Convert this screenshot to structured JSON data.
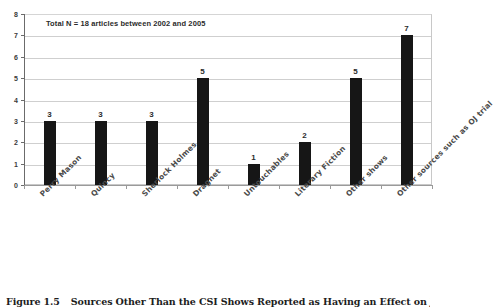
{
  "chart_data": {
    "type": "bar",
    "title": "",
    "subtitle": "",
    "annotation": "Total N = 18 articles between 2002 and 2005",
    "categories": [
      "Perry Mason",
      "Quincy",
      "Sherlock Holmes",
      "Dragnet",
      "Untouchables",
      "Literary Fiction",
      "Other shows",
      "Other sources such as OJ trial"
    ],
    "values": [
      3,
      3,
      3,
      5,
      1,
      2,
      5,
      7
    ],
    "value_labels": [
      "3",
      "3",
      "3",
      "5",
      "1",
      "2",
      "5",
      "7"
    ],
    "xlabel": "",
    "ylabel": "",
    "ylim": [
      0,
      8
    ],
    "ytick_labels": [
      "0",
      "1",
      "2",
      "3",
      "4",
      "5",
      "6",
      "7",
      "8"
    ],
    "ytick_values": [
      0,
      1,
      2,
      3,
      4,
      5,
      6,
      7,
      8
    ],
    "grid": true,
    "grid_axis": "y",
    "legend": false,
    "legend_position": "none",
    "bar_color": "#161616",
    "grid_color": "#cfcfcf",
    "axis_color": "#6b6b6b",
    "background_color": "#ffffff"
  },
  "caption": {
    "number": "Figure 1.5",
    "text": "Sources Other Than the CSI Shows Reported as Having an Effect on Jurors"
  }
}
